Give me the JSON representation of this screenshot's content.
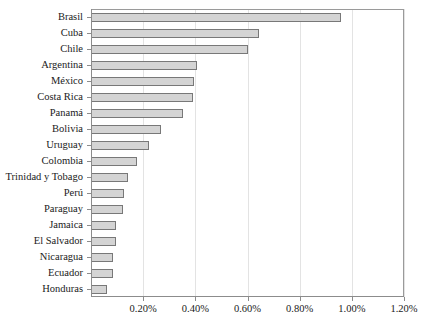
{
  "chart_data": {
    "type": "bar",
    "orientation": "horizontal",
    "title": "",
    "xlabel": "",
    "ylabel": "",
    "xlim": [
      0,
      1.2
    ],
    "grid": true,
    "legend": false,
    "xticks": [
      "0.20%",
      "0.40%",
      "0.60%",
      "0.80%",
      "1.00%",
      "1.20%"
    ],
    "xtick_values": [
      0.2,
      0.4,
      0.6,
      0.8,
      1.0,
      1.2
    ],
    "categories": [
      "Brasil",
      "Cuba",
      "Chile",
      "Argentina",
      "México",
      "Costa Rica",
      "Panamá",
      "Bolivia",
      "Uruguay",
      "Colombia",
      "Trinidad y Tobago",
      "Perú",
      "Paraguay",
      "Jamaica",
      "El Salvador",
      "Nicaragua",
      "Ecuador",
      "Honduras"
    ],
    "values": [
      0.958,
      0.645,
      0.6,
      0.408,
      0.396,
      0.392,
      0.351,
      0.268,
      0.223,
      0.177,
      0.14,
      0.125,
      0.121,
      0.094,
      0.094,
      0.083,
      0.083,
      0.06
    ],
    "colors": {
      "bar_fill": "#d4d4d4",
      "bar_border": "#787878",
      "gridline": "#e3e3e3",
      "axis": "#8c8c8c",
      "text": "#1a1a1a",
      "background": "#ffffff"
    }
  }
}
